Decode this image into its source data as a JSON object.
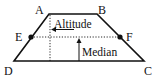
{
  "diagram": {
    "type": "trapezoid",
    "vertices": {
      "A": {
        "label": "A"
      },
      "B": {
        "label": "B"
      },
      "C": {
        "label": "C"
      },
      "D": {
        "label": "D"
      }
    },
    "midpoints": {
      "E": {
        "label": "E"
      },
      "F": {
        "label": "F"
      }
    },
    "annotations": {
      "altitude": "Altitude",
      "median": "Median"
    },
    "colors": {
      "stroke": "#111111",
      "background": "#ffffff"
    }
  }
}
